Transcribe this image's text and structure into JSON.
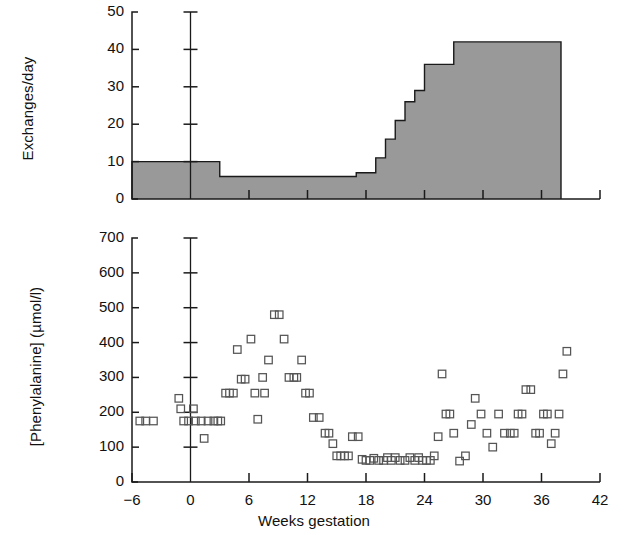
{
  "figure": {
    "x_axis_title": "Weeks gestation",
    "x_ticks": [
      "−6",
      "0",
      "6",
      "12",
      "18",
      "24",
      "30",
      "36",
      "42"
    ],
    "x_tick_values": [
      -6,
      0,
      6,
      12,
      18,
      24,
      30,
      36,
      42
    ],
    "x_min": -6,
    "x_max": 42,
    "marker_color": "#555555",
    "fill_color": "#999999",
    "axis_color": "#1a1a1a"
  },
  "panel_top": {
    "y_axis_title": "Exchanges/day",
    "y_ticks": [
      "0",
      "10",
      "20",
      "30",
      "40",
      "50"
    ],
    "y_tick_values": [
      0,
      10,
      20,
      30,
      40,
      50
    ],
    "y_min": 0,
    "y_max": 50
  },
  "panel_bottom": {
    "y_axis_title": "[Phenylalanine] (µmol/l)",
    "y_ticks": [
      "0",
      "100",
      "200",
      "300",
      "400",
      "500",
      "600",
      "700"
    ],
    "y_tick_values": [
      0,
      100,
      200,
      300,
      400,
      500,
      600,
      700
    ],
    "y_min": 0,
    "y_max": 700
  },
  "chart_data": [
    {
      "type": "area",
      "id": "exchanges-per-day",
      "title": "",
      "xlabel": "Weeks gestation",
      "ylabel": "Exchanges/day",
      "xlim": [
        -6,
        42
      ],
      "ylim": [
        0,
        50
      ],
      "grid": false,
      "legend": "none",
      "step_style": "post",
      "description": "Stepped/staircase filled area of daily exchanges versus weeks gestation",
      "steps": [
        {
          "x_start": -6,
          "x_end": 3,
          "value": 10
        },
        {
          "x_start": 3,
          "x_end": 17,
          "value": 6
        },
        {
          "x_start": 17,
          "x_end": 19,
          "value": 7
        },
        {
          "x_start": 19,
          "x_end": 20,
          "value": 11
        },
        {
          "x_start": 20,
          "x_end": 21,
          "value": 16
        },
        {
          "x_start": 21,
          "x_end": 22,
          "value": 21
        },
        {
          "x_start": 22,
          "x_end": 23,
          "value": 26
        },
        {
          "x_start": 23,
          "x_end": 24,
          "value": 29
        },
        {
          "x_start": 24,
          "x_end": 27,
          "value": 36
        },
        {
          "x_start": 27,
          "x_end": 38,
          "value": 42
        }
      ]
    },
    {
      "type": "scatter",
      "id": "phenylalanine-concentration",
      "title": "",
      "xlabel": "Weeks gestation",
      "ylabel": "[Phenylalanine] (µmol/l)",
      "xlim": [
        -6,
        42
      ],
      "ylim": [
        0,
        700
      ],
      "grid": false,
      "legend": "none",
      "marker": "open-square",
      "description": "Open square markers of maternal blood phenylalanine concentration versus weeks gestation",
      "points": [
        [
          -5.2,
          175
        ],
        [
          -4.6,
          175
        ],
        [
          -3.8,
          175
        ],
        [
          -1.2,
          240
        ],
        [
          -1.0,
          210
        ],
        [
          -0.7,
          175
        ],
        [
          -0.2,
          175
        ],
        [
          0.3,
          210
        ],
        [
          0.5,
          175
        ],
        [
          1.1,
          175
        ],
        [
          1.4,
          125
        ],
        [
          1.8,
          175
        ],
        [
          2.4,
          175
        ],
        [
          2.8,
          175
        ],
        [
          3.1,
          175
        ],
        [
          3.6,
          255
        ],
        [
          4.0,
          255
        ],
        [
          4.4,
          255
        ],
        [
          4.8,
          380
        ],
        [
          5.2,
          295
        ],
        [
          5.6,
          295
        ],
        [
          6.2,
          410
        ],
        [
          6.6,
          255
        ],
        [
          6.9,
          180
        ],
        [
          7.4,
          300
        ],
        [
          7.6,
          255
        ],
        [
          8.0,
          350
        ],
        [
          8.6,
          480
        ],
        [
          9.1,
          480
        ],
        [
          9.6,
          410
        ],
        [
          10.1,
          300
        ],
        [
          10.6,
          300
        ],
        [
          10.9,
          300
        ],
        [
          11.4,
          350
        ],
        [
          11.8,
          255
        ],
        [
          12.2,
          255
        ],
        [
          12.6,
          185
        ],
        [
          13.2,
          185
        ],
        [
          13.8,
          140
        ],
        [
          14.2,
          140
        ],
        [
          14.6,
          110
        ],
        [
          15.0,
          75
        ],
        [
          15.4,
          75
        ],
        [
          15.8,
          75
        ],
        [
          16.2,
          75
        ],
        [
          16.6,
          130
        ],
        [
          17.2,
          130
        ],
        [
          17.6,
          65
        ],
        [
          18.0,
          62
        ],
        [
          18.4,
          62
        ],
        [
          18.8,
          68
        ],
        [
          19.3,
          62
        ],
        [
          19.8,
          62
        ],
        [
          20.2,
          70
        ],
        [
          20.6,
          62
        ],
        [
          21.0,
          70
        ],
        [
          21.5,
          62
        ],
        [
          22.0,
          62
        ],
        [
          22.5,
          70
        ],
        [
          23.0,
          62
        ],
        [
          23.4,
          70
        ],
        [
          23.8,
          62
        ],
        [
          24.2,
          62
        ],
        [
          24.6,
          62
        ],
        [
          25.0,
          75
        ],
        [
          25.4,
          130
        ],
        [
          25.8,
          310
        ],
        [
          26.2,
          195
        ],
        [
          26.6,
          195
        ],
        [
          27.0,
          140
        ],
        [
          27.6,
          60
        ],
        [
          28.2,
          75
        ],
        [
          28.8,
          165
        ],
        [
          29.2,
          240
        ],
        [
          29.8,
          195
        ],
        [
          30.4,
          140
        ],
        [
          31.0,
          100
        ],
        [
          31.6,
          195
        ],
        [
          32.2,
          140
        ],
        [
          32.8,
          140
        ],
        [
          33.2,
          140
        ],
        [
          33.6,
          195
        ],
        [
          34.0,
          195
        ],
        [
          34.4,
          265
        ],
        [
          34.9,
          265
        ],
        [
          35.4,
          140
        ],
        [
          35.8,
          140
        ],
        [
          36.2,
          195
        ],
        [
          36.6,
          195
        ],
        [
          37.0,
          110
        ],
        [
          37.4,
          140
        ],
        [
          37.8,
          195
        ],
        [
          38.2,
          310
        ],
        [
          38.6,
          375
        ]
      ]
    }
  ]
}
